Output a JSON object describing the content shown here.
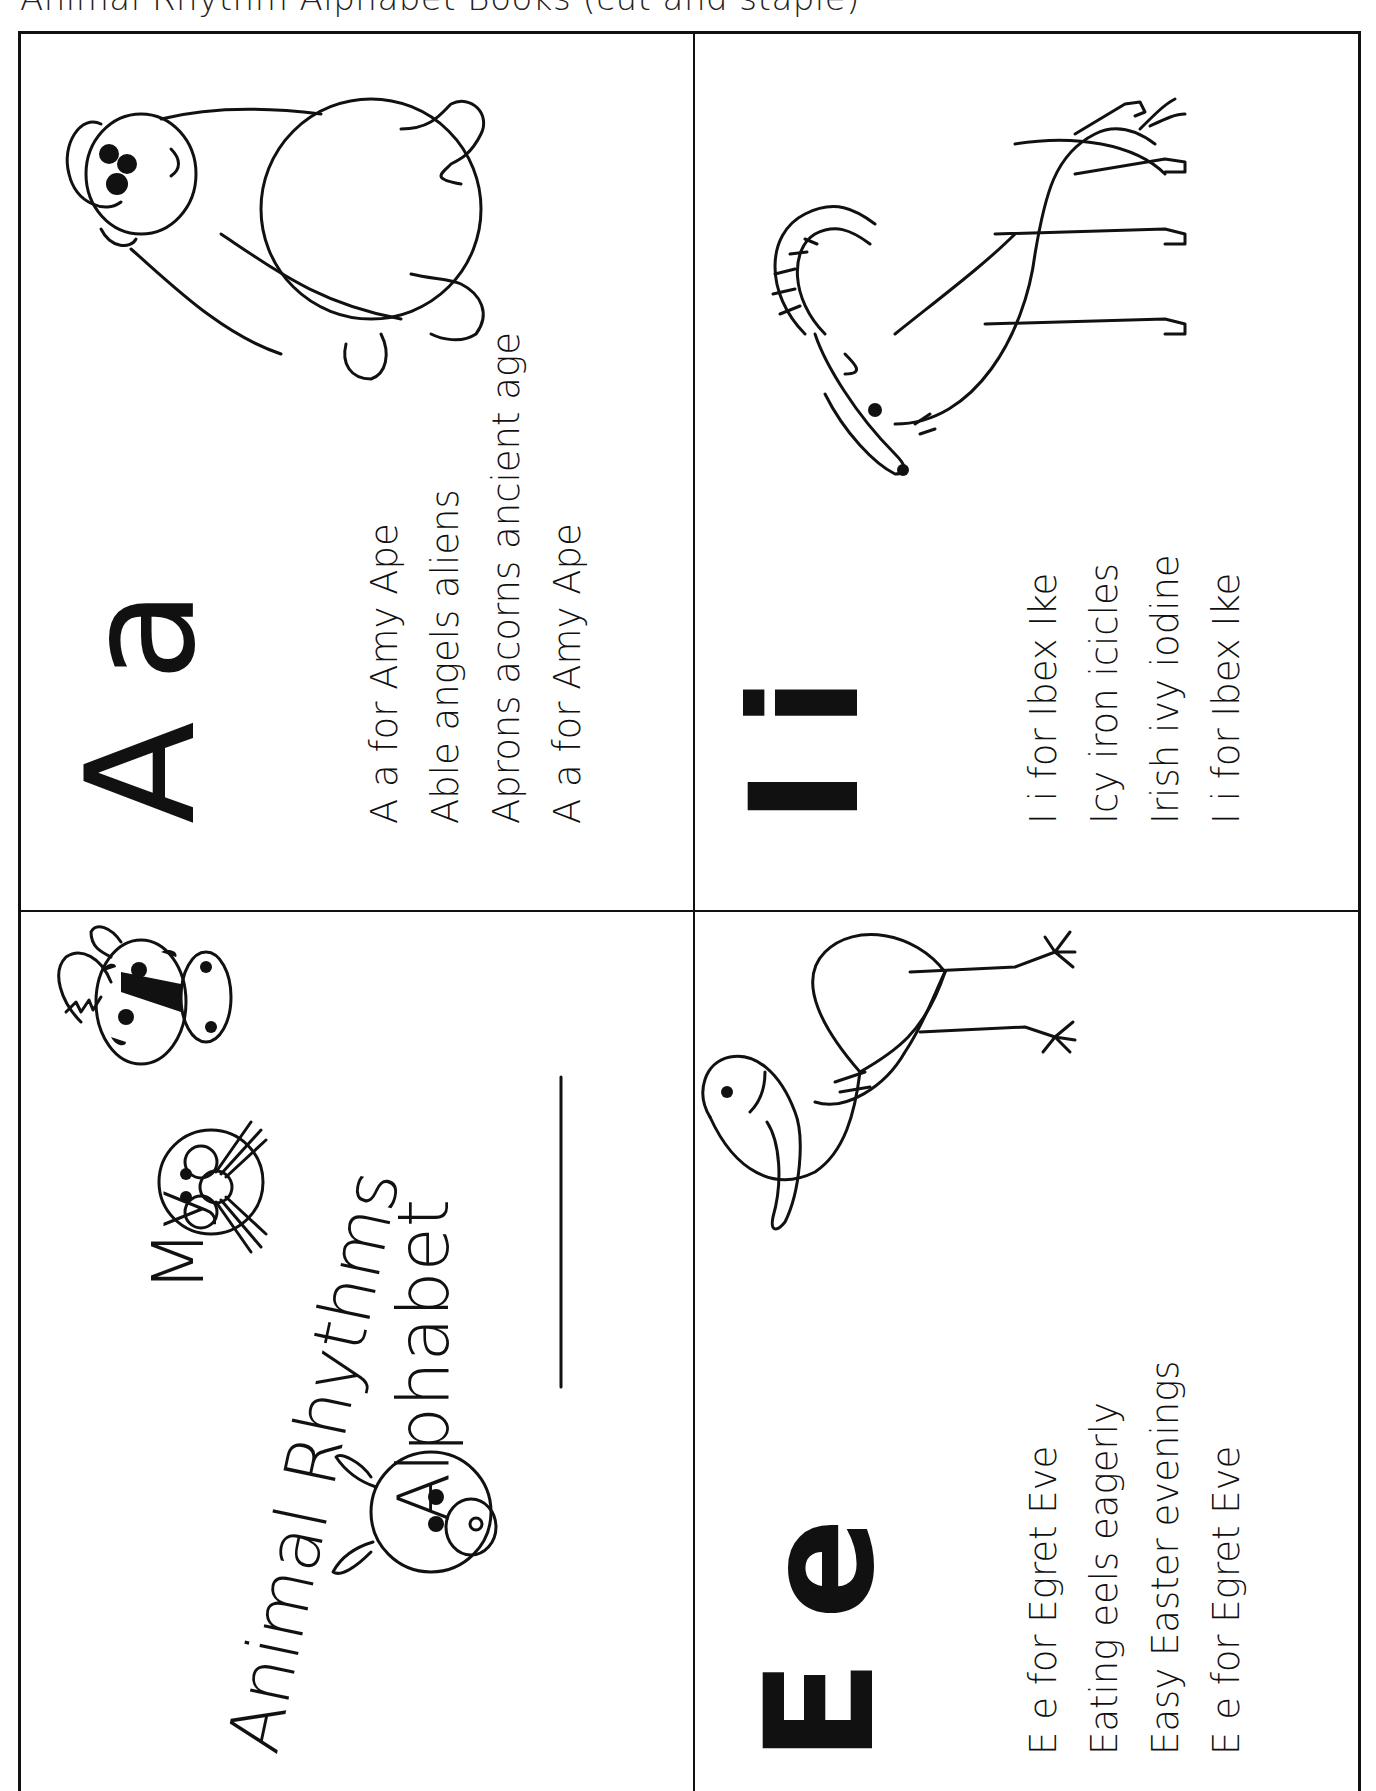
{
  "header": {
    "text": "Animal Rhythm Alphabet Books (cut and staple)"
  },
  "cover": {
    "title_line1": "My",
    "title_line2": "Animal Rhythms",
    "title_line3": "Alphabet",
    "name_line_label": "",
    "illustrations": [
      "zebra-icon",
      "cat-icon",
      "pig-icon"
    ]
  },
  "pages": [
    {
      "id": "a",
      "letter_upper": "A",
      "letter_lower": "a",
      "animal": "ape",
      "rhyme": [
        "A a for Amy Ape",
        "Able angels aliens",
        "Aprons acorns ancient age",
        "A a for Amy Ape"
      ]
    },
    {
      "id": "e",
      "letter_upper": "E",
      "letter_lower": "e",
      "animal": "egret",
      "rhyme": [
        "E e for Egret Eve",
        "Eating eels eagerly",
        "Easy Easter evenings",
        "E e for Egret Eve"
      ]
    },
    {
      "id": "i",
      "letter_upper": "I",
      "letter_lower": "i",
      "animal": "ibex",
      "rhyme": [
        "I i for Ibex Ike",
        "Icy iron icicles",
        "Irish ivy iodine",
        "I i for Ibex Ike"
      ]
    }
  ],
  "colors": {
    "ink": "#111111",
    "paper": "#ffffff"
  }
}
